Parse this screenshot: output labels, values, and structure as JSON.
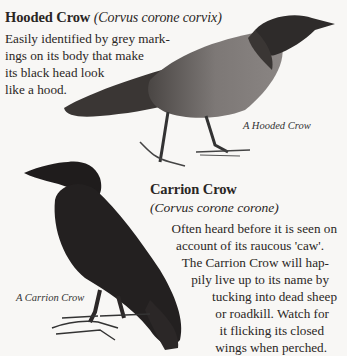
{
  "hooded": {
    "name": "Hooded Crow",
    "scientific": "(Corvus corone corvix)",
    "lines": [
      "Easily identified by grey mark-",
      "ings on its body that make",
      "its black head look",
      "like a hood."
    ],
    "caption": "A Hooded Crow"
  },
  "carrion": {
    "name": "Carrion Crow",
    "scientific": "(Corvus corone corone)",
    "lines": [
      "Often heard before it is seen on",
      "account of its raucous 'caw'.",
      "The Carrion Crow will hap-",
      "pily live up to its name by",
      "tucking into dead sheep",
      "or roadkill. Watch for",
      "it flicking its closed",
      "wings when perched."
    ],
    "caption": "A Carrion Crow"
  },
  "colors": {
    "background": "#f8f7f5",
    "text": "#2a2624",
    "grey_plumage": "#7a7573",
    "black_plumage": "#232020"
  }
}
